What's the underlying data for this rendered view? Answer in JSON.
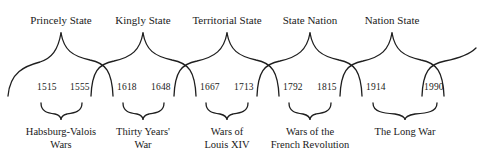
{
  "diagram": {
    "states": [
      {
        "label": "Princely State",
        "x": 61
      },
      {
        "label": "Kingly State",
        "x": 143
      },
      {
        "label": "Territorial State",
        "x": 227
      },
      {
        "label": "State Nation",
        "x": 310
      },
      {
        "label": "Nation State",
        "x": 392
      }
    ],
    "years": [
      {
        "label": "1515",
        "x": 41
      },
      {
        "label": "1555",
        "x": 69
      },
      {
        "label": "1618",
        "x": 118
      },
      {
        "label": "1648",
        "x": 150
      },
      {
        "label": "1667",
        "x": 202
      },
      {
        "label": "1713",
        "x": 233
      },
      {
        "label": "1792",
        "x": 285
      },
      {
        "label": "1815",
        "x": 318
      },
      {
        "label": "1914",
        "x": 367
      },
      {
        "label": "1990",
        "x": 424
      }
    ],
    "wars": [
      {
        "line1": "Habsburg-Valois",
        "line2": "Wars",
        "x": 61
      },
      {
        "line1": "Thirty Years'",
        "line2": "War",
        "x": 143
      },
      {
        "line1": "Wars of",
        "line2": "Louis XIV",
        "x": 227
      },
      {
        "line1": "Wars of the",
        "line2": "French Revolution",
        "x": 310
      },
      {
        "line1": "The Long War",
        "line2": "",
        "x": 405
      }
    ]
  }
}
